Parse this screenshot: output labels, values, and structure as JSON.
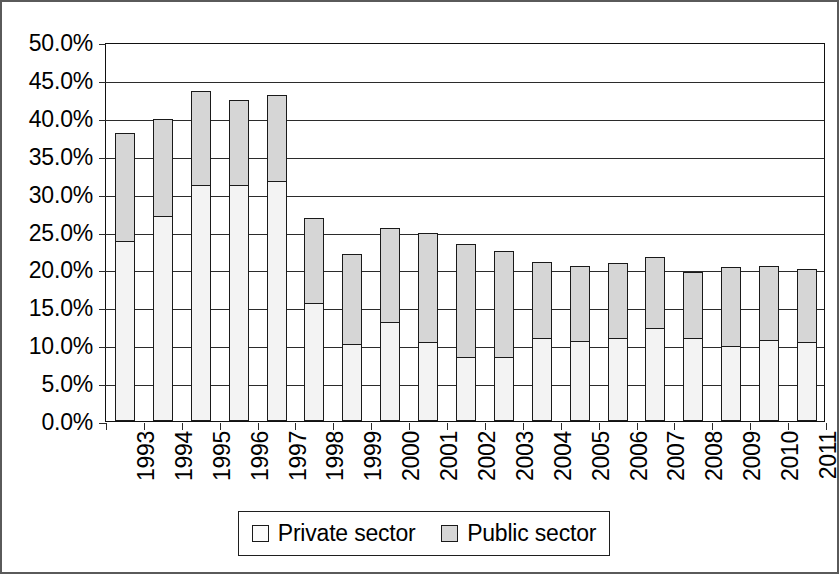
{
  "chart_data": {
    "type": "bar",
    "subtype": "stacked-column",
    "title": "",
    "subtitle": "",
    "xlabel": "",
    "ylabel": "",
    "grid": true,
    "legend_position": "bottom",
    "ylim": [
      0,
      50
    ],
    "ytick_step": 5,
    "ytick_labels": [
      "0.0%",
      "5.0%",
      "10.0%",
      "15.0%",
      "20.0%",
      "25.0%",
      "30.0%",
      "35.0%",
      "40.0%",
      "45.0%",
      "50.0%"
    ],
    "ytick_values": [
      0,
      5,
      10,
      15,
      20,
      25,
      30,
      35,
      40,
      45,
      50
    ],
    "categories": [
      "1993",
      "1994",
      "1995",
      "1996",
      "1997",
      "1998",
      "1999",
      "2000",
      "2001",
      "2002",
      "2003",
      "2004",
      "2005",
      "2006",
      "2007",
      "2008",
      "2009",
      "2010",
      "2011"
    ],
    "series": [
      {
        "name": "Private sector",
        "color": "#f3f3f3",
        "values": [
          23.8,
          27.0,
          31.1,
          31.2,
          31.7,
          15.6,
          10.2,
          13.0,
          10.4,
          8.4,
          8.5,
          11.0,
          10.5,
          11.0,
          12.3,
          11.0,
          9.9,
          10.7,
          10.4
        ]
      },
      {
        "name": "Public sector",
        "color": "#d6d6d6",
        "values": [
          14.4,
          13.0,
          12.6,
          11.4,
          11.5,
          11.4,
          12.0,
          12.7,
          14.6,
          15.1,
          14.1,
          10.2,
          10.2,
          10.0,
          9.5,
          8.9,
          10.6,
          10.0,
          9.8
        ]
      }
    ],
    "totals": [
      38.2,
      40.0,
      43.7,
      42.6,
      43.2,
      27.0,
      22.2,
      25.7,
      25.0,
      23.5,
      22.6,
      21.2,
      20.7,
      21.0,
      21.8,
      19.9,
      20.5,
      20.7,
      20.2
    ]
  },
  "legend": {
    "items": [
      {
        "label": "Private sector",
        "swatch": "private"
      },
      {
        "label": "Public sector",
        "swatch": "public"
      }
    ]
  }
}
